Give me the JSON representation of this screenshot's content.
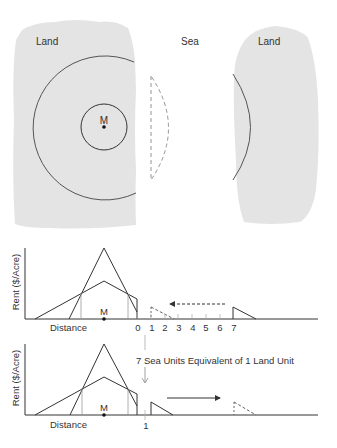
{
  "map": {
    "left_land_label": "Land",
    "sea_label": "Sea",
    "right_land_label": "Land",
    "market_label": "M",
    "colors": {
      "land": "#e4e4e4",
      "line": "#555555",
      "dashed": "#888888"
    }
  },
  "graph_top": {
    "ylabel": "Rent ($/Acre)",
    "xlabel": "Distance",
    "market_label": "M",
    "ticks": [
      "0",
      "1",
      "2",
      "3",
      "4",
      "5",
      "6",
      "7"
    ],
    "arrow_direction": "left",
    "arrow_style": "dashed"
  },
  "graph_bottom": {
    "ylabel": "Rent ($/Acre)",
    "xlabel": "Distance",
    "market_label": "M",
    "ticks": [
      "1"
    ],
    "annotation": "7 Sea Units Equivalent of 1 Land Unit",
    "arrow_direction": "right",
    "arrow_style": "solid"
  }
}
